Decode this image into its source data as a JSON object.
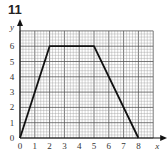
{
  "question_number": "11",
  "chart_data": {
    "type": "line",
    "title": "",
    "xlabel": "x",
    "ylabel": "y",
    "xlim": [
      0,
      9
    ],
    "ylim": [
      0,
      7
    ],
    "x_ticks": [
      "0",
      "1",
      "2",
      "3",
      "4",
      "5",
      "6",
      "7",
      "8"
    ],
    "y_ticks": [
      "0",
      "1",
      "2",
      "3",
      "4",
      "5",
      "6"
    ],
    "grid": true,
    "series": [
      {
        "name": "graph",
        "x": [
          0,
          2,
          5,
          8
        ],
        "y": [
          0,
          6,
          6,
          0
        ]
      }
    ]
  }
}
